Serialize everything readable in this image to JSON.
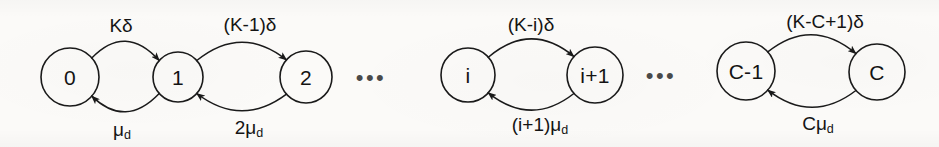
{
  "diagram": {
    "background_color": "#fbfaf8",
    "stroke_color": "#1a1a1a",
    "nodes": [
      {
        "id": "n0",
        "label": "0",
        "cx": 70,
        "cy": 77,
        "r": 29
      },
      {
        "id": "n1",
        "label": "1",
        "cx": 178,
        "cy": 77,
        "r": 25
      },
      {
        "id": "n2",
        "label": "2",
        "cx": 306,
        "cy": 77,
        "r": 26
      },
      {
        "id": "ni",
        "label": "i",
        "cx": 468,
        "cy": 75,
        "r": 27
      },
      {
        "id": "ni1",
        "label": "i+1",
        "cx": 595,
        "cy": 75,
        "r": 28
      },
      {
        "id": "ncm1",
        "label": "C-1",
        "cx": 746,
        "cy": 71,
        "r": 29
      },
      {
        "id": "nc",
        "label": "C",
        "cx": 877,
        "cy": 72,
        "r": 28
      }
    ],
    "ellipses": [
      {
        "id": "e1",
        "text": "•••",
        "cx": 371,
        "cy": 78
      },
      {
        "id": "e2",
        "text": "•••",
        "cx": 661,
        "cy": 76
      }
    ],
    "edges": [
      {
        "id": "f01",
        "from": "n0",
        "to": "n1",
        "direction": "forward",
        "label_text": "K",
        "label_sym": "δ",
        "label_sub": "",
        "label_x": 121,
        "label_y": 25
      },
      {
        "id": "b10",
        "from": "n1",
        "to": "n0",
        "direction": "backward",
        "label_text": "",
        "label_sym": "μ",
        "label_sub": "d",
        "label_x": 122,
        "label_y": 131
      },
      {
        "id": "f12",
        "from": "n1",
        "to": "n2",
        "direction": "forward",
        "label_text": "(K-1)",
        "label_sym": "δ",
        "label_sub": "",
        "label_x": 250,
        "label_y": 24
      },
      {
        "id": "b21",
        "from": "n2",
        "to": "n1",
        "direction": "backward",
        "label_text": "2",
        "label_sym": "μ",
        "label_sub": "d",
        "label_x": 249,
        "label_y": 129
      },
      {
        "id": "fi",
        "from": "ni",
        "to": "ni1",
        "direction": "forward",
        "label_text": "(K-i)",
        "label_sym": "δ",
        "label_sub": "",
        "label_x": 531,
        "label_y": 24
      },
      {
        "id": "bi",
        "from": "ni1",
        "to": "ni",
        "direction": "backward",
        "label_text": "(i+1)",
        "label_sym": "μ",
        "label_sub": "d",
        "label_x": 540,
        "label_y": 126
      },
      {
        "id": "fc",
        "from": "ncm1",
        "to": "nc",
        "direction": "forward",
        "label_text": "(K-C+1)",
        "label_sym": "δ",
        "label_sub": "",
        "label_x": 825,
        "label_y": 21
      },
      {
        "id": "bc",
        "from": "nc",
        "to": "ncm1",
        "direction": "backward",
        "label_text": "C",
        "label_sym": "μ",
        "label_sub": "d",
        "label_x": 818,
        "label_y": 125
      }
    ]
  }
}
